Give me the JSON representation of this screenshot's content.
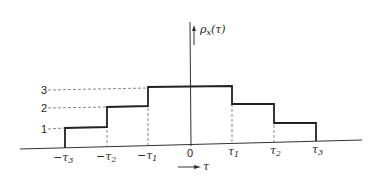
{
  "figure": {
    "y_axis_label": "ρ",
    "y_axis_sub": "x",
    "y_axis_arg": "(τ)",
    "x_axis_label": "τ",
    "origin_label": "0",
    "y_ticks": [
      "1",
      "2",
      "3"
    ],
    "x_ticks": [
      "−τ",
      "−τ",
      "−τ",
      "τ",
      "τ",
      "τ"
    ],
    "x_tick_subs": [
      "3",
      "2",
      "1",
      "1",
      "2",
      "3"
    ]
  },
  "step_function": {
    "intervals": [
      {
        "from": "-τ3",
        "to": "-τ2",
        "value": 1
      },
      {
        "from": "-τ2",
        "to": "-τ1",
        "value": 2
      },
      {
        "from": "-τ1",
        "to": "τ1",
        "value": 3
      },
      {
        "from": "τ1",
        "to": "τ2",
        "value": 2
      },
      {
        "from": "τ2",
        "to": "τ3",
        "value": 1
      }
    ]
  }
}
